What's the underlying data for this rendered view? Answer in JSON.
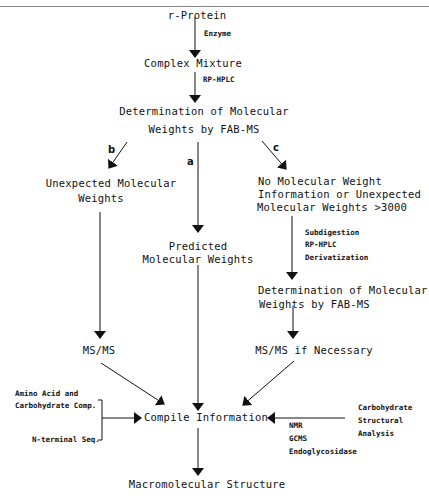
{
  "nodes": {
    "r_protein": "r-Protein",
    "complex_mixture": "Complex Mixture",
    "determination_1_line1": "Determination of Molecular",
    "determination_1_line2": "Weights by FAB-MS",
    "unexpected_line1": "Unexpected Molecular",
    "unexpected_line2": "Weights",
    "predicted_line1": "Predicted",
    "predicted_line2": "Molecular Weights",
    "no_mw_line1": "No Molecular Weight",
    "no_mw_line2": "Information or Unexpected",
    "no_mw_line3": "Molecular Weights >3000",
    "determination_2_line1": "Determination of Molecular",
    "determination_2_line2": "Weights by FAB-MS",
    "msms": "MS/MS",
    "msms_if_necessary": "MS/MS if Necessary",
    "compile": "Compile Information",
    "macromolecular": "Macromolecular Structure"
  },
  "edge_labels": {
    "enzyme": "Enzyme",
    "rp_hplc": "RP-HPLC",
    "branch_a": "a",
    "branch_b": "b",
    "branch_c": "c",
    "subdigestion": "Subdigestion",
    "rp_hplc_2": "RP-HPLC",
    "derivatization": "Derivatization"
  },
  "side_inputs": {
    "left_line1": "Amino Acid and",
    "left_line2": "Carbohydrate Comp.",
    "left_line3": "N-terminal Seq.",
    "right_line1": "Carbohydrate",
    "right_line2": "Structural",
    "right_line3": "Analysis",
    "right_methods": [
      "NMR",
      "GCMS",
      "Endoglycosidase"
    ]
  }
}
